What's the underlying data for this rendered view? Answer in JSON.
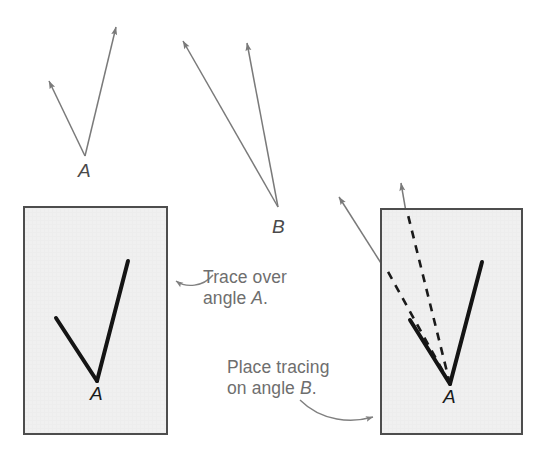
{
  "figure": {
    "background_color": "#ffffff",
    "ray_color": "#7a7a7a",
    "traced_line_color": "#141414",
    "paper_fill": "#f0f0f0",
    "paper_border": "#4d4d4d",
    "caption_color": "#6e6e6e"
  },
  "labels": {
    "angle_a_top": "A",
    "angle_b_top": "B",
    "angle_a_traced_left": "A",
    "angle_a_traced_right": "A"
  },
  "captions": {
    "trace_line1": "Trace over",
    "trace_line2_prefix": "angle ",
    "trace_line2_italic": "A",
    "trace_line2_suffix": ".",
    "place_line1": "Place tracing",
    "place_line2_prefix": "on angle ",
    "place_line2_italic": "B",
    "place_line2_suffix": "."
  },
  "angles": {
    "angle_a_original": {
      "name": "angle A",
      "vertex": [
        85,
        156
      ],
      "ray1_tip": [
        46,
        77
      ],
      "ray2_tip": [
        117,
        22
      ],
      "style": "gray-arrow"
    },
    "angle_b_original": {
      "name": "angle B",
      "vertex": [
        278,
        207
      ],
      "ray1_tip": [
        180,
        36
      ],
      "ray2_tip": [
        246,
        38
      ],
      "style": "gray-arrow"
    },
    "angle_a_tracing_left": {
      "name": "traced angle A on paper",
      "vertex": [
        97,
        381
      ],
      "arm1_end": [
        56,
        318
      ],
      "arm2_end": [
        128,
        261
      ],
      "style": "black-solid"
    },
    "angle_a_tracing_right": {
      "name": "traced angle A on paper over angle B",
      "vertex": [
        450,
        384
      ],
      "arm1_end": [
        410,
        320
      ],
      "arm2_end": [
        482,
        262
      ],
      "style": "black-solid"
    },
    "angle_b_under_tracing": {
      "name": "angle B showing through tracing paper",
      "vertex": [
        450,
        384
      ],
      "ray1_tip": [
        336,
        193
      ],
      "ray2_tip": [
        400,
        179
      ],
      "style": "dashed-inside-gray-arrow-outside"
    }
  },
  "papers": [
    {
      "name": "tracing-paper-left",
      "x": 24,
      "y": 207,
      "width": 143,
      "height": 227
    },
    {
      "name": "tracing-paper-right",
      "x": 381,
      "y": 209,
      "width": 141,
      "height": 225
    }
  ],
  "pointers": [
    {
      "name": "trace-over-pointer",
      "from": [
        213,
        277
      ],
      "to": [
        171,
        281
      ],
      "direction": "left"
    },
    {
      "name": "place-tracing-pointer",
      "from": [
        308,
        403
      ],
      "to": [
        378,
        418
      ],
      "direction": "right"
    }
  ]
}
